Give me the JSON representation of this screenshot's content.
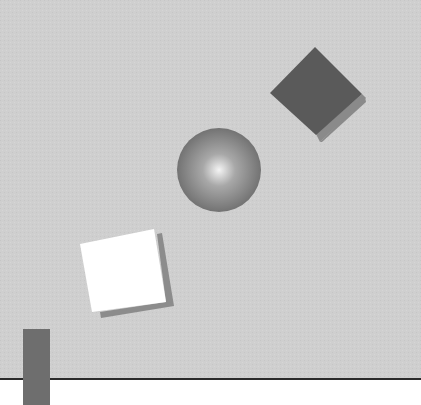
{
  "scene": {
    "title": "Geometric shapes illustration",
    "colors": {
      "background": "#cfcfcf",
      "ground": "#ffffff",
      "horizon_line": "#2a2a2a",
      "diamond_fill": "#5a5a5a",
      "diamond_shadow": "#8a8a8a",
      "sphere_highlight": "#f4f4f4",
      "sphere_mid": "#a0a0a0",
      "sphere_edge": "#6a6a6a",
      "square_fill": "#ffffff",
      "square_shadow": "#8c8c8c",
      "bar_fill": "#6e6e6e"
    },
    "shapes": [
      {
        "name": "dark-diamond",
        "type": "rotated-square"
      },
      {
        "name": "shaded-sphere",
        "type": "sphere"
      },
      {
        "name": "white-tilted-square",
        "type": "tilted-square"
      },
      {
        "name": "vertical-bar",
        "type": "rectangle"
      }
    ]
  }
}
